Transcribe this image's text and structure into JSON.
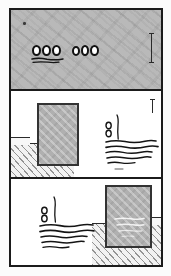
{
  "document": {
    "kind": "three-panel-comic-strip",
    "orientation": "vertical",
    "reproduction": "photocopy-halftone-scan",
    "panel_count": 3,
    "alt_text": "A vertical three-panel black-and-white comic strip. Panel one is a flat gray field with two clusters of three small oval marks and a short underline. Panels two and three each show a hatched ground line, a shaded rectangular block and a cluster of illegible handwritten scribble lines, mirrored left to right."
  },
  "palette": {
    "ink": "#1b1b1b",
    "panel_gray": "#b9b9b9",
    "block_gray": "#b0b0b0",
    "block_border": "#333333",
    "ground_fill": "#f2f2f2",
    "hatch_ink": "#464646",
    "paper_white": "#ffffff",
    "page_white": "#fbfbfb"
  },
  "panels": [
    {
      "id": "panel-1",
      "index": 1,
      "caption": "Flat gray field with two groups of three oval marks",
      "background": "uniform gray with diagonal moire banding",
      "has_ground": false,
      "has_block": false,
      "marks": {
        "oval_groups": [
          {
            "id": "oval-group-left",
            "count": 3,
            "has_underline": true
          },
          {
            "id": "oval-group-right",
            "count": 3,
            "has_underline": false
          }
        ],
        "specks": 1,
        "margin_rule": true
      }
    },
    {
      "id": "panel-2",
      "index": 2,
      "caption": "Block standing on hatched ground at left, scribbled lines at right",
      "background": "white",
      "has_ground": true,
      "has_block": true,
      "block_side": "left",
      "scribble_side": "right",
      "marks": {
        "scribble_lines": 5,
        "scribble_loops": 2,
        "scribble_stem": true,
        "margin_rule": true
      }
    },
    {
      "id": "panel-3",
      "index": 3,
      "caption": "Scribbled lines at left, block standing on hatched ground at right",
      "background": "white",
      "has_ground": true,
      "has_block": true,
      "block_side": "right",
      "scribble_side": "left",
      "marks": {
        "scribble_lines": 5,
        "scribble_loops": 2,
        "scribble_stem": true,
        "margin_rule": false
      }
    }
  ],
  "text_content": {
    "legible_text": "",
    "note": "No legible lettering is present; all writing is rendered as illegible scribble strokes."
  }
}
